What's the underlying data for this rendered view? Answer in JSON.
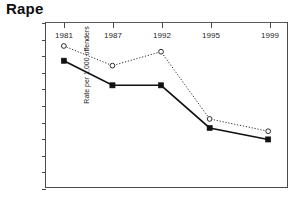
{
  "chart_data": {
    "type": "line",
    "title": "Rape",
    "xlabel": "",
    "ylabel": "Rate per 1,000 offenders",
    "categories": [
      "1981",
      "1987",
      "1992",
      "1995",
      "1999"
    ],
    "x_tick_labels": [
      "1981",
      "1987",
      "1992",
      "1995",
      "1999"
    ],
    "y_tick_labels": [
      "200",
      "180",
      "160",
      "140",
      "120",
      "100",
      "80",
      "60",
      "40",
      "20",
      "0"
    ],
    "y_ticks": [
      200,
      180,
      160,
      140,
      120,
      100,
      80,
      60,
      40,
      20,
      0
    ],
    "ylim": [
      0,
      200
    ],
    "grid": false,
    "legend": "none",
    "series": [
      {
        "name": "open-circle-dotted-series",
        "marker": "open-circle",
        "line_style": "dotted",
        "color": "#2b2b2b",
        "values": [
          172,
          148,
          165,
          83,
          68
        ]
      },
      {
        "name": "filled-square-solid-series",
        "marker": "filled-square",
        "line_style": "solid",
        "color": "#111111",
        "values": [
          154,
          124,
          124,
          72,
          58
        ]
      }
    ]
  }
}
